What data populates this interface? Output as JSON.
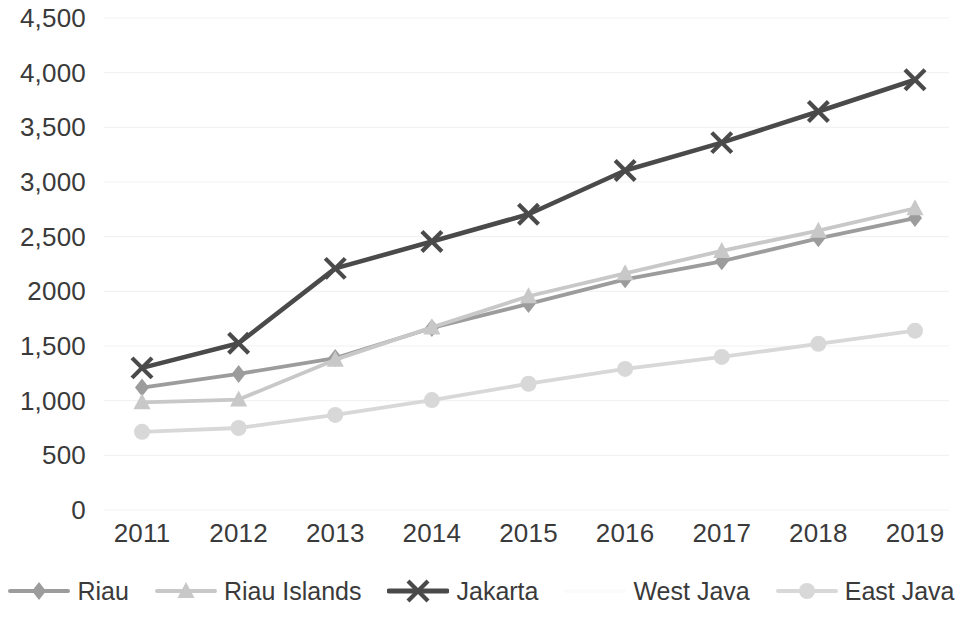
{
  "chart_data": {
    "type": "line",
    "title": "",
    "subtitle": "",
    "xlabel": "",
    "ylabel": "",
    "x": [
      2011,
      2012,
      2013,
      2014,
      2015,
      2016,
      2017,
      2018,
      2019
    ],
    "categories": [
      "2011",
      "2012",
      "2013",
      "2014",
      "2015",
      "2016",
      "2017",
      "2018",
      "2019"
    ],
    "ylim": [
      0,
      4500
    ],
    "ytick_values": [
      0,
      500,
      1000,
      1500,
      2000,
      2500,
      3000,
      3500,
      4000,
      4500
    ],
    "ytick_labels": [
      "0",
      "500",
      "1,000",
      "1,500",
      "2000",
      "2,500",
      "3,000",
      "3,500",
      "4,000",
      "4,500"
    ],
    "grid": true,
    "grid_axis": "y",
    "legend_position": "bottom",
    "series": [
      {
        "name": "Riau",
        "marker": "diamond",
        "color": "#9c9c9c",
        "values": [
          1120,
          1245,
          1390,
          1665,
          1885,
          2110,
          2275,
          2485,
          2670
        ]
      },
      {
        "name": "Riau Islands",
        "marker": "triangle",
        "color": "#c8c8c8",
        "values": [
          985,
          1010,
          1375,
          1670,
          1955,
          2165,
          2370,
          2555,
          2760
        ]
      },
      {
        "name": "Jakarta",
        "marker": "x",
        "color": "#4a4a4a",
        "values": [
          1300,
          1525,
          2210,
          2455,
          2705,
          3105,
          3360,
          3645,
          3935
        ]
      },
      {
        "name": "West Java",
        "marker": "none",
        "color": "#fbfbfb",
        "values": [
          null,
          null,
          null,
          null,
          null,
          null,
          null,
          null,
          null
        ]
      },
      {
        "name": "East Java",
        "marker": "circle",
        "color": "#d8d8d8",
        "values": [
          715,
          750,
          870,
          1005,
          1155,
          1290,
          1400,
          1520,
          1640
        ]
      }
    ]
  },
  "axes": {
    "y_ticks": [
      "4,500",
      "4,000",
      "3,500",
      "3,000",
      "2,500",
      "2000",
      "1,500",
      "1,000",
      "500",
      "0"
    ],
    "x_ticks": [
      "2011",
      "2012",
      "2013",
      "2014",
      "2015",
      "2016",
      "2017",
      "2018",
      "2019"
    ]
  },
  "legend": {
    "items": [
      {
        "label": "Riau"
      },
      {
        "label": "Riau Islands"
      },
      {
        "label": "Jakarta"
      },
      {
        "label": "West Java"
      },
      {
        "label": "East Java"
      }
    ]
  },
  "colors": {
    "riau": "#9c9c9c",
    "riau_islands": "#c8c8c8",
    "jakarta": "#4a4a4a",
    "west_java": "#fbfbfb",
    "east_java": "#d8d8d8",
    "grid": "#f2f2f2",
    "text": "#3a3a3a",
    "background": "#ffffff"
  }
}
